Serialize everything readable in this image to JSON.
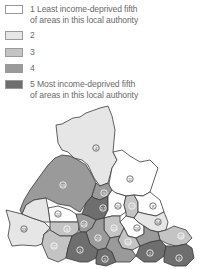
{
  "legend": {
    "items": [
      {
        "label": "1 Least income-deprived fifth",
        "label2": "of areas in this local authority",
        "quintile": 1,
        "color": "#ffffff"
      },
      {
        "label": "2",
        "quintile": 2,
        "color": "#e6e6e6"
      },
      {
        "label": "3",
        "quintile": 3,
        "color": "#c4c4c4"
      },
      {
        "label": "4",
        "quintile": 4,
        "color": "#9a9a9a"
      },
      {
        "label": "5 Most income-deprived fifth",
        "label2": "of areas in this local authority",
        "quintile": 5,
        "color": "#6e6e6e"
      }
    ]
  },
  "map": {
    "regions": [
      {
        "id": "4",
        "label": "4",
        "quintile": 2
      },
      {
        "id": "19",
        "label": "19",
        "quintile": 4
      },
      {
        "id": "11",
        "label": "11",
        "quintile": 1
      },
      {
        "id": "13",
        "label": "13",
        "quintile": 2
      },
      {
        "id": "22",
        "label": "22",
        "quintile": 1
      },
      {
        "id": "6",
        "label": "6",
        "quintile": 3
      },
      {
        "id": "9",
        "label": "9",
        "quintile": 4
      },
      {
        "id": "17",
        "label": "17",
        "quintile": 5
      },
      {
        "id": "20",
        "label": "20",
        "quintile": 1
      },
      {
        "id": "7",
        "label": "7",
        "quintile": 3
      },
      {
        "id": "8",
        "label": "8",
        "quintile": 1
      },
      {
        "id": "12",
        "label": "12",
        "quintile": 3
      },
      {
        "id": "16",
        "label": "16",
        "quintile": 1
      },
      {
        "id": "14",
        "label": "14",
        "quintile": 2
      },
      {
        "id": "10",
        "label": "10",
        "quintile": 3
      },
      {
        "id": "15",
        "label": "15",
        "quintile": 3
      },
      {
        "id": "21",
        "label": "21",
        "quintile": 4
      },
      {
        "id": "18",
        "label": "18",
        "quintile": 3
      },
      {
        "id": "1",
        "label": "1",
        "quintile": 5
      },
      {
        "id": "5",
        "label": "5",
        "quintile": 5
      },
      {
        "id": "2",
        "label": "2",
        "quintile": 5
      },
      {
        "id": "3",
        "label": "3",
        "quintile": 5
      },
      {
        "id": "23",
        "label": "23",
        "quintile": 2
      },
      {
        "id": "24",
        "label": "24",
        "quintile": 4
      }
    ]
  }
}
